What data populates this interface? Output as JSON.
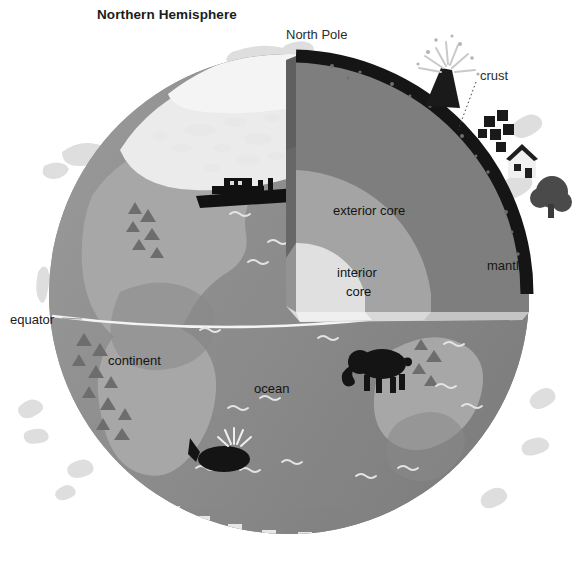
{
  "figure": {
    "title": "Northern Hemisphere"
  },
  "labels": {
    "north_pole": "North Pole",
    "crust": "crust",
    "mantle": "mantle",
    "exterior_core": "exterior core",
    "interior_core_line1": "interior",
    "interior_core_line2": "core",
    "equator": "equator",
    "continent": "continent",
    "ocean": "ocean"
  },
  "colors": {
    "background": "#ffffff",
    "ocean": "#8d8d8d",
    "ocean_light": "#9a9a9a",
    "continent": "#a9a9a9",
    "continent_dark": "#8a8a8a",
    "ice_cap": "#e9e9e9",
    "ice_floe": "#dcdcdc",
    "crust": "#171717",
    "mantle": "#7b7b7b",
    "exterior_core": "#a6a6a6",
    "interior_core": "#e2e2e2",
    "cut_face_mantle": "#6b6b6b",
    "cut_face_exterior": "#9a9a9a",
    "cut_face_interior": "#d2d2d2",
    "equator_line": "#f2f2f2",
    "text": "#1b1b1b",
    "silhouette": "#141414"
  },
  "scene": {
    "globe_center": {
      "x": 289,
      "y": 294
    },
    "globe_radius": 240,
    "cutaway": "quarter wedge removed from upper-right, revealing crust, mantle, exterior core and interior core",
    "illustrations": [
      "polar-ice-cap",
      "ice-floes",
      "ship",
      "whale",
      "elephant",
      "volcano",
      "buildings",
      "house",
      "tree",
      "mountain-ranges",
      "wave-marks"
    ]
  }
}
